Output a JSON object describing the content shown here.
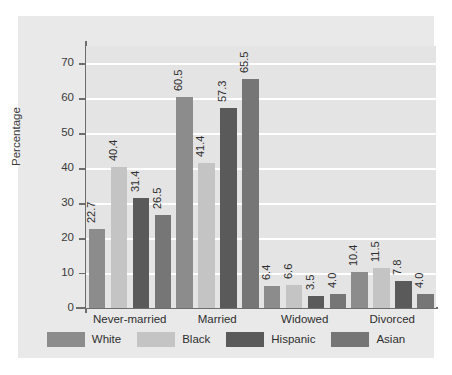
{
  "chart_data": {
    "type": "bar",
    "title": "",
    "xlabel": "",
    "ylabel": "Percentage",
    "categories": [
      "Never-married",
      "Married",
      "Widowed",
      "Divorced"
    ],
    "series": [
      {
        "name": "White",
        "color": "#8c8c8c",
        "values": [
          22.7,
          60.5,
          6.4,
          10.4
        ]
      },
      {
        "name": "Black",
        "color": "#c4c4c4",
        "values": [
          40.4,
          41.4,
          6.6,
          11.5
        ]
      },
      {
        "name": "Hispanic",
        "color": "#5a5a5a",
        "values": [
          31.4,
          57.3,
          3.5,
          7.8
        ]
      },
      {
        "name": "Asian",
        "color": "#767676",
        "values": [
          26.5,
          65.5,
          4.0,
          4.0
        ]
      }
    ],
    "value_labels": [
      [
        "22.7",
        "40.4",
        "31.4",
        "26.5"
      ],
      [
        "60.5",
        "41.4",
        "57.3",
        "65.5"
      ],
      [
        "6.4",
        "6.6",
        "3.5",
        "4.0"
      ],
      [
        "10.4",
        "11.5",
        "7.8",
        "4.0"
      ]
    ],
    "yticks": [
      0,
      10,
      20,
      30,
      40,
      50,
      60,
      70
    ],
    "ytick_labels": [
      "0",
      "10",
      "20",
      "30",
      "40",
      "50",
      "60",
      "70"
    ],
    "ylim": [
      0,
      75
    ],
    "grid": true,
    "gridline_color": "#ffffff",
    "legend_position": "bottom",
    "panel_background": "#e9e9e9",
    "plot_background": "#e4e4e4",
    "axis_color": "#6d6d6d",
    "text_color": "#2e2e2e"
  }
}
